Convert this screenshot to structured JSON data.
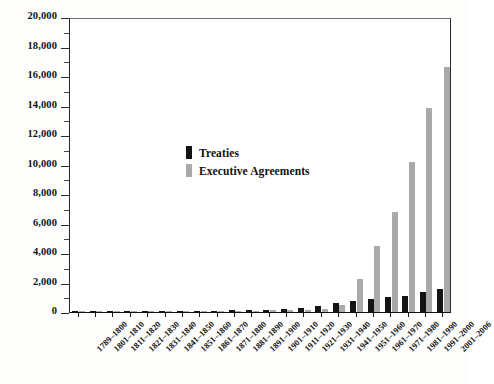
{
  "chart_data": {
    "type": "bar",
    "title": "",
    "subtitle": "",
    "xlabel": "",
    "ylabel": "",
    "ylim": [
      0,
      20000
    ],
    "ytick_step": 2000,
    "yminor_step": 1000,
    "grid": false,
    "legend_position": "inside-upper-left",
    "orientation": "vertical",
    "bar_mode": "grouped",
    "categories": [
      "1789–1800",
      "1801–1810",
      "1811–1820",
      "1821–1830",
      "1831–1840",
      "1841–1850",
      "1851–1860",
      "1861–1870",
      "1871–1880",
      "1881–1890",
      "1891–1900",
      "1901–1910",
      "1911–1920",
      "1921–1930",
      "1931–1940",
      "1941–1950",
      "1951–1960",
      "1961–1970",
      "1971–1980",
      "1981–1990",
      "1991–2000",
      "2001–2006"
    ],
    "ytick_labels": [
      "0",
      "2,000",
      "4,000",
      "6,000",
      "8,000",
      "10,000",
      "12,000",
      "14,000",
      "16,000",
      "18,000",
      "20,000"
    ],
    "ytick_values": [
      0,
      2000,
      4000,
      6000,
      8000,
      10000,
      12000,
      14000,
      16000,
      18000,
      20000
    ],
    "series": [
      {
        "name": "Treaties",
        "color": "#141414",
        "values": [
          60,
          27,
          40,
          30,
          35,
          40,
          55,
          40,
          60,
          105,
          110,
          135,
          185,
          245,
          390,
          600,
          720,
          910,
          1010,
          1090,
          1380,
          1560
        ]
      },
      {
        "name": "Executive Agreements",
        "color": "#a9a9a9",
        "values": [
          25,
          10,
          12,
          15,
          15,
          25,
          35,
          30,
          45,
          80,
          70,
          110,
          130,
          170,
          200,
          460,
          2250,
          4450,
          6750,
          10200,
          13800,
          16600
        ]
      }
    ]
  },
  "legend": {
    "items": [
      {
        "label": "Treaties",
        "color": "#141414"
      },
      {
        "label": "Executive Agreements",
        "color": "#a9a9a9"
      }
    ]
  },
  "colors": {
    "treaties": "#141414",
    "agreements": "#a9a9a9",
    "axis": "#1d1d1d",
    "background": "#ffffff"
  }
}
